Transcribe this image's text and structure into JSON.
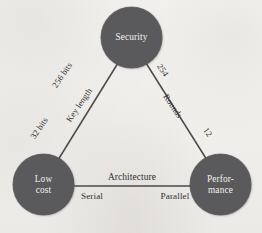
{
  "diagram": {
    "type": "triangle-tradeoff-diagram",
    "background_color": "#f4f3f1",
    "node_fill_color": "#5a5a5c",
    "node_text_color": "#f2f1ef",
    "edge_color": "#4a4a4c",
    "label_text_color": "#2e2e30",
    "nodes": [
      {
        "id": "security",
        "label": "Security",
        "label_line1": "Security",
        "label_line2": "",
        "center_x": 132,
        "center_y": 38,
        "radius": 30
      },
      {
        "id": "low-cost",
        "label": "Low cost",
        "label_line1": "Low",
        "label_line2": "cost",
        "center_x": 44,
        "center_y": 185,
        "radius": 30
      },
      {
        "id": "performance",
        "label": "Performance",
        "label_line1": "Perfor-",
        "label_line2": "mance",
        "center_x": 221,
        "center_y": 185,
        "radius": 30
      }
    ],
    "edges": [
      {
        "id": "key-length",
        "from": "security",
        "to": "low-cost",
        "axis_label": "Key length",
        "value_near_from": "256 bits",
        "value_near_to": "32 bits"
      },
      {
        "id": "rounds",
        "from": "security",
        "to": "performance",
        "axis_label": "Rounds",
        "value_near_from": "254",
        "value_near_to": "12"
      },
      {
        "id": "architecture",
        "from": "low-cost",
        "to": "performance",
        "axis_label": "Architecture",
        "value_near_from": "Serial",
        "value_near_to": "Parallel"
      }
    ]
  }
}
